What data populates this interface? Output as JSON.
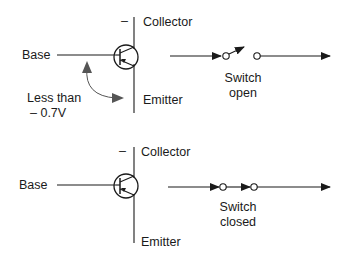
{
  "diagram": {
    "title": "",
    "colors": {
      "stroke": "#1a1a1a",
      "background": "#ffffff"
    },
    "panels": [
      {
        "id": "off",
        "labels": {
          "base": "Base",
          "collector": "Collector",
          "emitter": "Emitter",
          "minus": "–",
          "voltage_line1": "Less than",
          "voltage_line2": "– 0.7V",
          "switch_line1": "Switch",
          "switch_line2": "open"
        },
        "switch_state": "open"
      },
      {
        "id": "on",
        "labels": {
          "base": "Base",
          "collector": "Collector",
          "emitter": "Emitter",
          "minus": "–",
          "switch_line1": "Switch",
          "switch_line2": "closed"
        },
        "switch_state": "closed"
      }
    ]
  }
}
